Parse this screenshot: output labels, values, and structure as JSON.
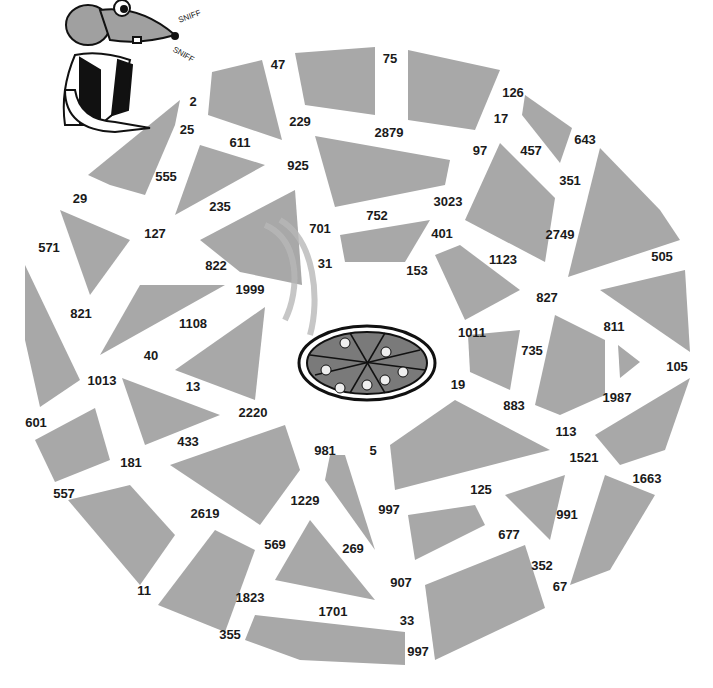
{
  "puzzle": {
    "type": "number-path maze",
    "fill_color": "#a8a8a8",
    "center_item": "pizza",
    "character": "mouse-sniffing",
    "sound_effects": [
      "SNIFF",
      "SNIFF"
    ],
    "numbers": [
      {
        "v": "2",
        "x": 193,
        "y": 101
      },
      {
        "v": "25",
        "x": 187,
        "y": 129
      },
      {
        "v": "47",
        "x": 278,
        "y": 64
      },
      {
        "v": "75",
        "x": 390,
        "y": 58
      },
      {
        "v": "126",
        "x": 513,
        "y": 92
      },
      {
        "v": "17",
        "x": 501,
        "y": 118
      },
      {
        "v": "643",
        "x": 585,
        "y": 139
      },
      {
        "v": "611",
        "x": 240,
        "y": 142
      },
      {
        "v": "229",
        "x": 300,
        "y": 121
      },
      {
        "v": "2879",
        "x": 389,
        "y": 132
      },
      {
        "v": "97",
        "x": 480,
        "y": 150
      },
      {
        "v": "457",
        "x": 531,
        "y": 150
      },
      {
        "v": "555",
        "x": 166,
        "y": 176
      },
      {
        "v": "925",
        "x": 298,
        "y": 165
      },
      {
        "v": "351",
        "x": 570,
        "y": 180
      },
      {
        "v": "29",
        "x": 80,
        "y": 198
      },
      {
        "v": "235",
        "x": 220,
        "y": 206
      },
      {
        "v": "701",
        "x": 320,
        "y": 228
      },
      {
        "v": "752",
        "x": 377,
        "y": 215
      },
      {
        "v": "3023",
        "x": 448,
        "y": 201
      },
      {
        "v": "127",
        "x": 155,
        "y": 233
      },
      {
        "v": "2749",
        "x": 560,
        "y": 234
      },
      {
        "v": "401",
        "x": 442,
        "y": 233
      },
      {
        "v": "571",
        "x": 49,
        "y": 247
      },
      {
        "v": "31",
        "x": 325,
        "y": 263
      },
      {
        "v": "153",
        "x": 417,
        "y": 270
      },
      {
        "v": "822",
        "x": 216,
        "y": 265
      },
      {
        "v": "1123",
        "x": 503,
        "y": 259
      },
      {
        "v": "505",
        "x": 662,
        "y": 256
      },
      {
        "v": "1999",
        "x": 250,
        "y": 289
      },
      {
        "v": "827",
        "x": 547,
        "y": 297
      },
      {
        "v": "821",
        "x": 81,
        "y": 313
      },
      {
        "v": "1108",
        "x": 193,
        "y": 323
      },
      {
        "v": "811",
        "x": 614,
        "y": 326
      },
      {
        "v": "1011",
        "x": 472,
        "y": 332
      },
      {
        "v": "735",
        "x": 532,
        "y": 350
      },
      {
        "v": "40",
        "x": 151,
        "y": 355
      },
      {
        "v": "105",
        "x": 677,
        "y": 366
      },
      {
        "v": "1013",
        "x": 102,
        "y": 380
      },
      {
        "v": "13",
        "x": 193,
        "y": 386
      },
      {
        "v": "19",
        "x": 458,
        "y": 384
      },
      {
        "v": "883",
        "x": 514,
        "y": 405
      },
      {
        "v": "1987",
        "x": 617,
        "y": 397
      },
      {
        "v": "2220",
        "x": 253,
        "y": 412
      },
      {
        "v": "601",
        "x": 36,
        "y": 422
      },
      {
        "v": "113",
        "x": 566,
        "y": 431
      },
      {
        "v": "433",
        "x": 188,
        "y": 441
      },
      {
        "v": "981",
        "x": 325,
        "y": 450
      },
      {
        "v": "5",
        "x": 373,
        "y": 450
      },
      {
        "v": "1521",
        "x": 584,
        "y": 457
      },
      {
        "v": "181",
        "x": 131,
        "y": 462
      },
      {
        "v": "1663",
        "x": 647,
        "y": 478
      },
      {
        "v": "557",
        "x": 64,
        "y": 493
      },
      {
        "v": "125",
        "x": 481,
        "y": 489
      },
      {
        "v": "1229",
        "x": 305,
        "y": 500
      },
      {
        "v": "997",
        "x": 389,
        "y": 509
      },
      {
        "v": "2619",
        "x": 205,
        "y": 513
      },
      {
        "v": "991",
        "x": 567,
        "y": 514
      },
      {
        "v": "677",
        "x": 509,
        "y": 534
      },
      {
        "v": "569",
        "x": 275,
        "y": 544
      },
      {
        "v": "269",
        "x": 353,
        "y": 548
      },
      {
        "v": "352",
        "x": 542,
        "y": 565
      },
      {
        "v": "907",
        "x": 401,
        "y": 582
      },
      {
        "v": "11",
        "x": 144,
        "y": 590
      },
      {
        "v": "67",
        "x": 560,
        "y": 586
      },
      {
        "v": "1823",
        "x": 250,
        "y": 597
      },
      {
        "v": "1701",
        "x": 333,
        "y": 611
      },
      {
        "v": "33",
        "x": 407,
        "y": 620
      },
      {
        "v": "355",
        "x": 230,
        "y": 634
      },
      {
        "v": "997",
        "x": 418,
        "y": 651
      }
    ]
  }
}
